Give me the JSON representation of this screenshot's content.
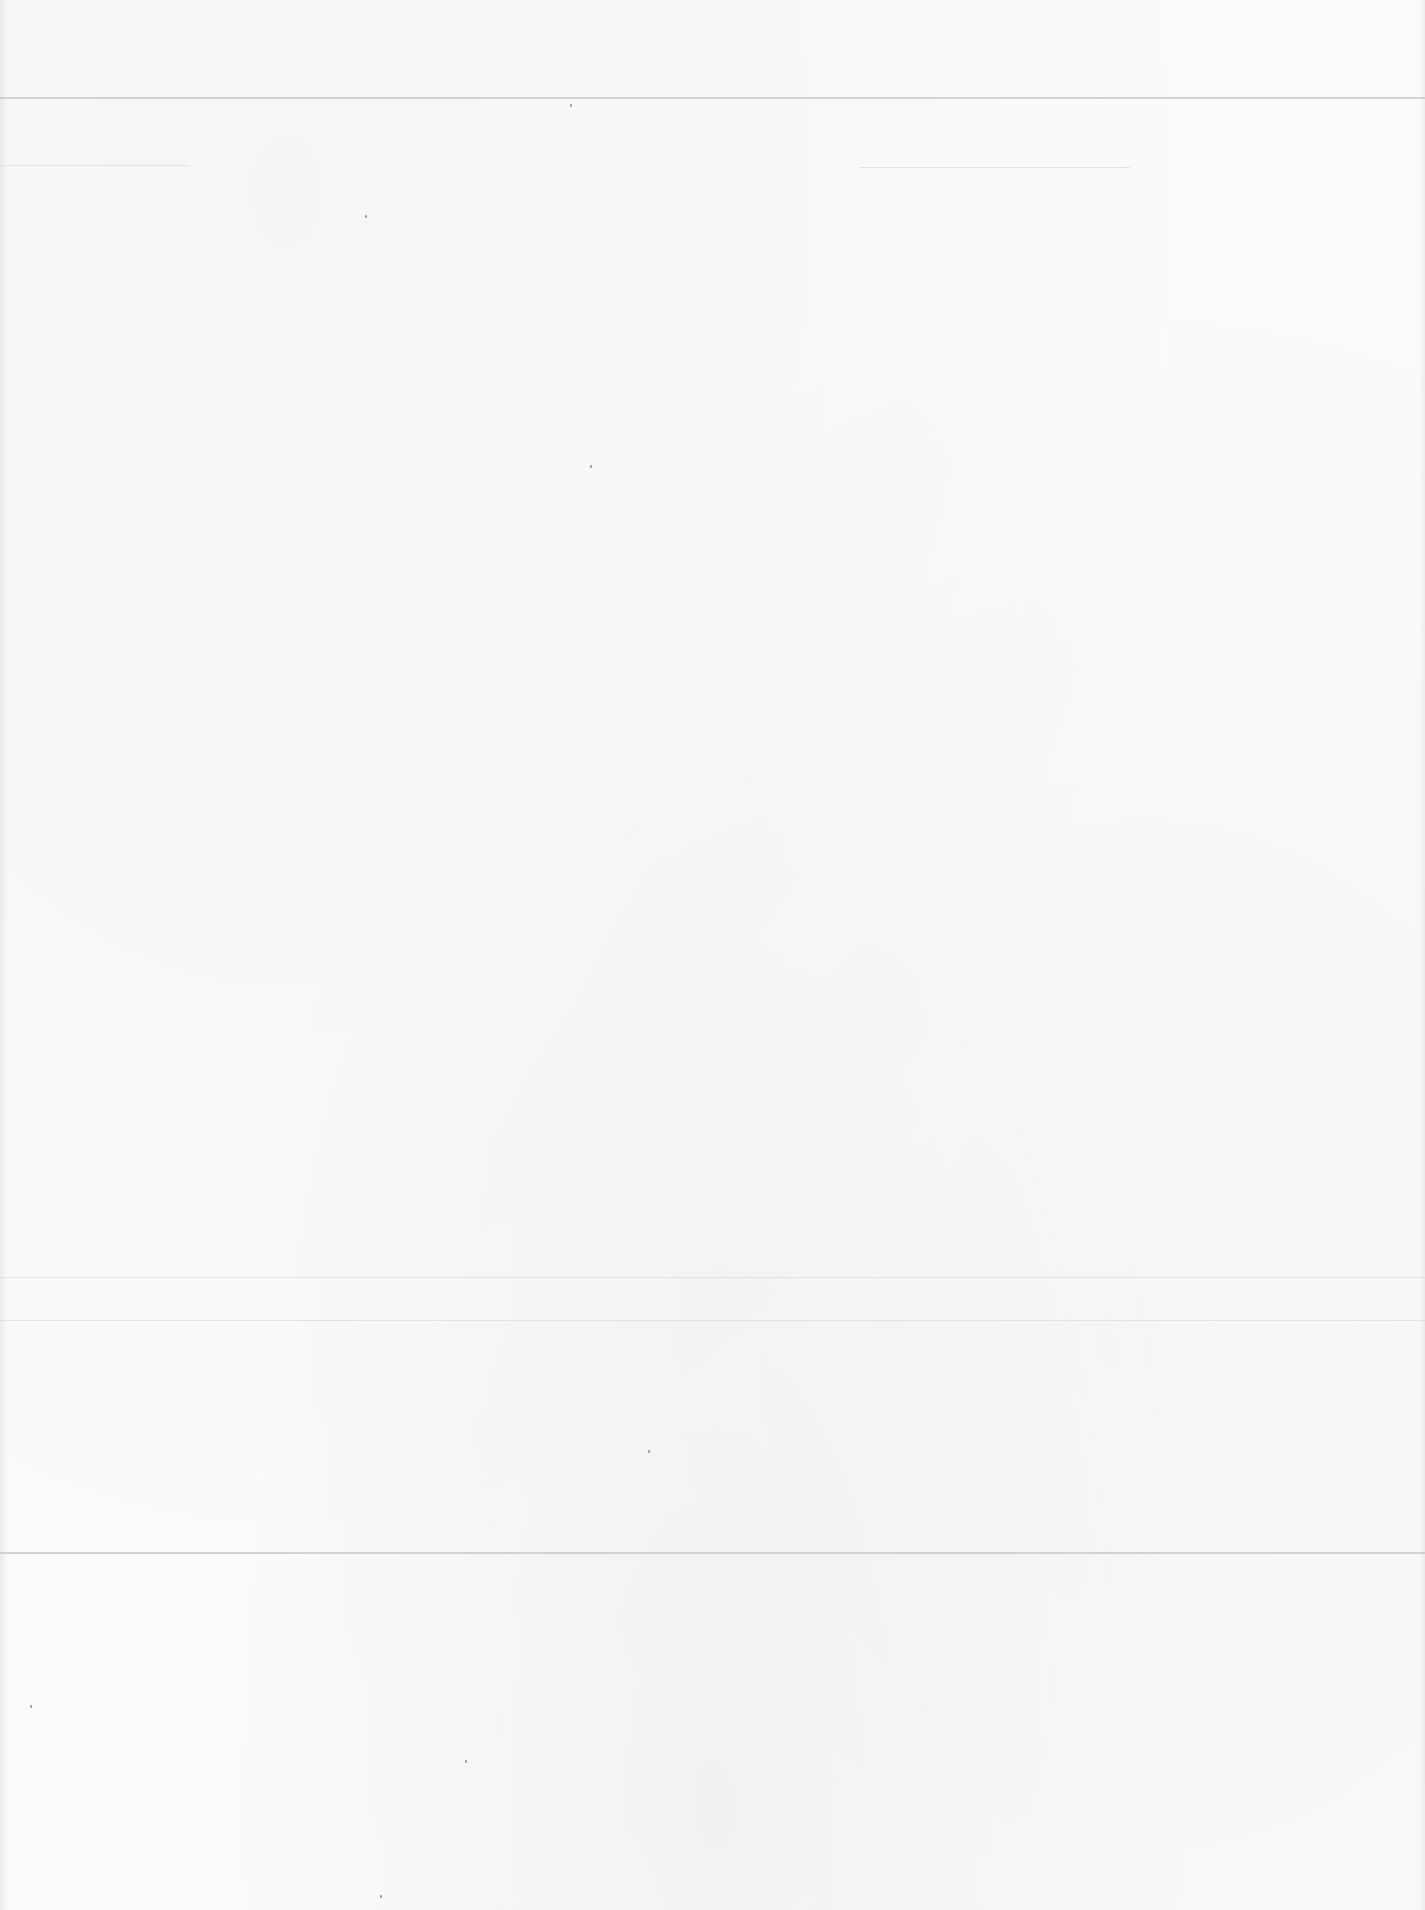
{
  "document": {
    "type": "blank scanned page",
    "text_content": ""
  },
  "rules": [
    {
      "y": 97,
      "x1": 0,
      "x2": 1425,
      "weight": "medium"
    },
    {
      "y": 165,
      "x1": 0,
      "x2": 190,
      "weight": "faint"
    },
    {
      "y": 167,
      "x1": 860,
      "x2": 1130,
      "weight": "faint"
    },
    {
      "y": 1277,
      "x1": 0,
      "x2": 1425,
      "weight": "faint"
    },
    {
      "y": 1320,
      "x1": 0,
      "x2": 1425,
      "weight": "faint"
    },
    {
      "y": 1552,
      "x1": 0,
      "x2": 1425,
      "weight": "medium"
    }
  ],
  "colors": {
    "paper": "#fbfbfb",
    "rule": "#c8c8c8"
  }
}
